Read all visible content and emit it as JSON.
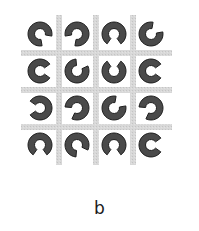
{
  "figure": {
    "caption": "b",
    "background": "#ffffff",
    "grid": {
      "color": "#d4d4d4",
      "line_width": 6,
      "vertical_lines_x": [
        59,
        96,
        133
      ],
      "horizontal_lines_y": [
        53,
        90,
        127
      ],
      "extent": {
        "x0": 21,
        "x1": 172,
        "y0": 15,
        "y1": 165
      }
    },
    "ring": {
      "fill": "#4a4a4a",
      "stroke": "#1e1e1e",
      "outer_radius": 12,
      "inner_radius": 5.5,
      "gap_degrees": 70
    },
    "cell_centers_x": [
      40,
      77,
      114,
      151
    ],
    "cell_centers_y": [
      34,
      71,
      108,
      145
    ],
    "rows": [
      {
        "gaps_deg": [
          45,
          135,
          90,
          315
        ]
      },
      {
        "gaps_deg": [
          0,
          300,
          270,
          0
        ]
      },
      {
        "gaps_deg": [
          180,
          150,
          315,
          150
        ]
      },
      {
        "gaps_deg": [
          90,
          60,
          90,
          0
        ]
      }
    ]
  }
}
